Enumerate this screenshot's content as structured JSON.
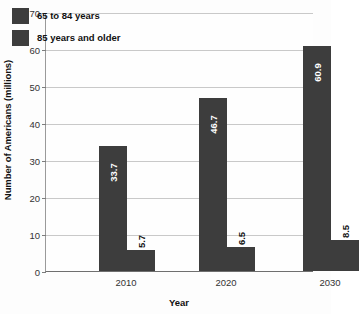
{
  "chart_data": {
    "type": "bar",
    "title": "",
    "xlabel": "Year",
    "ylabel": "Number of Americans (millions)",
    "categories": [
      "2010",
      "2020",
      "2030"
    ],
    "series": [
      {
        "name": "65 to 84 years",
        "values": [
          33.7,
          46.7,
          60.9
        ],
        "color": "#3d3d3d"
      },
      {
        "name": "85 years and older",
        "values": [
          5.7,
          6.5,
          8.5
        ],
        "color": "#3d3d3d"
      }
    ],
    "value_labels": [
      [
        "33.7",
        "46.7",
        "60.9"
      ],
      [
        "5.7",
        "6.5",
        "8.5"
      ]
    ],
    "ylim": [
      0,
      70
    ],
    "ytick_labels": [
      "0",
      "10",
      "20",
      "30",
      "40",
      "50",
      "60",
      "70"
    ],
    "ytick_values": [
      0,
      10,
      20,
      30,
      40,
      50,
      60,
      70
    ],
    "grid": true,
    "legend_position": "upper left"
  },
  "legend": {
    "items": [
      {
        "label": "65 to 84 years"
      },
      {
        "label": "85 years and older"
      }
    ]
  },
  "axes": {
    "x_title": "Year",
    "y_title": "Number of Americans (millions)"
  }
}
